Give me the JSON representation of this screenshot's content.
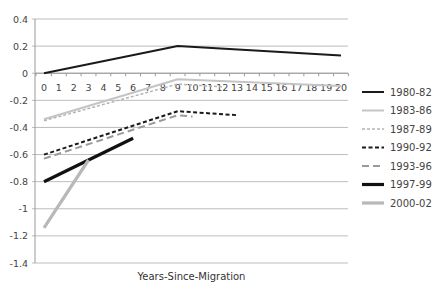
{
  "chart_data": {
    "type": "line",
    "title": "",
    "xlabel": "Years-Since-Migration",
    "ylabel": "",
    "xlim": [
      0,
      20
    ],
    "ylim": [
      -1.4,
      0.4
    ],
    "x_ticks": [
      0,
      1,
      2,
      3,
      4,
      5,
      6,
      7,
      8,
      9,
      10,
      11,
      12,
      13,
      14,
      15,
      16,
      17,
      18,
      19,
      20
    ],
    "y_ticks": [
      0.4,
      0.2,
      0,
      -0.2,
      -0.4,
      -0.6,
      -0.8,
      -1,
      -1.2,
      -1.4
    ],
    "y_tick_labels": [
      "0.4",
      "0.2",
      "0",
      "-0.2",
      "-0.4",
      "-0.6",
      "-0.8",
      "-1",
      "-1.2",
      "-1.4"
    ],
    "grid": "horizontal",
    "legend_position": "right",
    "series": [
      {
        "name": "1980-82",
        "color": "#1a1a1a",
        "style": "solid",
        "weight": "medium",
        "points": [
          [
            0,
            0.0
          ],
          [
            9,
            0.2
          ],
          [
            20,
            0.13
          ]
        ]
      },
      {
        "name": "1983-86",
        "color": "#c4c4c4",
        "style": "solid",
        "weight": "medium",
        "points": [
          [
            0,
            -0.34
          ],
          [
            9,
            -0.045
          ],
          [
            20,
            -0.095
          ]
        ]
      },
      {
        "name": "1987-89",
        "color": "#b4b4b4",
        "style": "dotted-dash",
        "weight": "thin",
        "points": [
          [
            0,
            -0.35
          ],
          [
            9,
            -0.08
          ],
          [
            12,
            -0.1
          ]
        ]
      },
      {
        "name": "1990-92",
        "color": "#1a1a1a",
        "style": "short-dash",
        "weight": "medium",
        "points": [
          [
            0,
            -0.6
          ],
          [
            9,
            -0.28
          ],
          [
            13,
            -0.31
          ]
        ]
      },
      {
        "name": "1993-96",
        "color": "#9a9a9a",
        "style": "long-dash",
        "weight": "medium",
        "points": [
          [
            0,
            -0.63
          ],
          [
            9,
            -0.31
          ],
          [
            10,
            -0.32
          ]
        ]
      },
      {
        "name": "1997-99",
        "color": "#111111",
        "style": "solid",
        "weight": "heavy",
        "points": [
          [
            0,
            -0.8
          ],
          [
            6,
            -0.48
          ]
        ]
      },
      {
        "name": "2000-02",
        "color": "#b8b8b8",
        "style": "solid",
        "weight": "heavy",
        "points": [
          [
            0,
            -1.14
          ],
          [
            3,
            -0.64
          ]
        ]
      }
    ]
  }
}
